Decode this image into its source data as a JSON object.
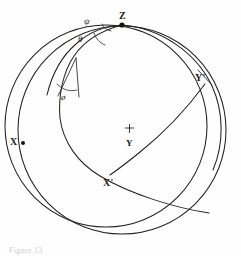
{
  "figure": {
    "kind": "stereographic-projection",
    "caption": "Figure 13",
    "background_color": "#fefefe",
    "line_color": "#24221f"
  },
  "points": [
    {
      "id": "Z",
      "label": "Z",
      "x": 122,
      "y": 24,
      "marker": "dot"
    },
    {
      "id": "X",
      "label": "X",
      "x": 21,
      "y": 142,
      "marker": "dot"
    },
    {
      "id": "Yp",
      "label": "Y'",
      "x": 203,
      "y": 82,
      "marker": "none"
    },
    {
      "id": "Xp",
      "label": "X'",
      "x": 112,
      "y": 174,
      "marker": "none"
    },
    {
      "id": "Y",
      "label": "Y",
      "x": 128,
      "y": 136,
      "marker": "cross"
    }
  ],
  "angles": [
    {
      "id": "psi",
      "label": "ψ",
      "x": 84,
      "y": 17
    },
    {
      "id": "theta",
      "label": "θ",
      "x": 78,
      "y": 35
    },
    {
      "id": "phi",
      "label": "ø",
      "x": 61,
      "y": 93
    }
  ],
  "circles": [
    {
      "id": "primitive-circle",
      "cx": 121,
      "cy": 128,
      "r": 105
    },
    {
      "id": "secondary-circle",
      "cx": 107,
      "cy": 126,
      "r": 102
    }
  ]
}
